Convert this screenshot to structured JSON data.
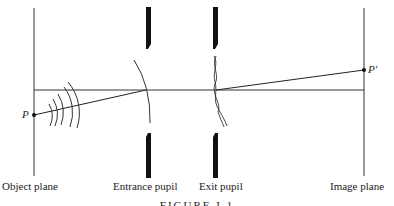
{
  "diagram": {
    "labels": {
      "object_plane": "Object plane",
      "entrance_pupil": "Entrance pupil",
      "exit_pupil": "Exit pupil",
      "image_plane": "Image plane"
    },
    "points": {
      "object_point": "P",
      "image_point": "P′"
    },
    "caption": "FIGURE I.1"
  }
}
